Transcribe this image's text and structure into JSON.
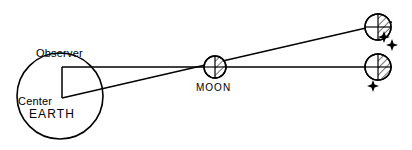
{
  "figure": {
    "type": "astronomy-parallax-diagram",
    "background_color": "#ffffff",
    "stroke_color": "#000000",
    "width": 412,
    "height": 150
  },
  "labels": {
    "observer": "Observer",
    "center": "Center",
    "earth": "EARTH",
    "moon": "MOON"
  },
  "bodies": {
    "earth": {
      "name": "EARTH",
      "cx": 60,
      "cy": 96,
      "r": 43,
      "filled": false
    },
    "moon_center": {
      "name": "MOON",
      "cx": 215,
      "cy": 67,
      "r": 11,
      "shaded_half": "right"
    },
    "moon_apparent_upper": {
      "name": "moon-apparent-from-center",
      "cx": 378,
      "cy": 27,
      "r": 13,
      "shaded_half": "right"
    },
    "moon_apparent_lower": {
      "name": "moon-apparent-from-observer",
      "cx": 378,
      "cy": 67,
      "r": 13,
      "shaded_half": "right"
    }
  },
  "points": {
    "observer": {
      "x": 62,
      "y": 67
    },
    "center": {
      "x": 62,
      "y": 98
    }
  },
  "sight_lines": [
    {
      "name": "observer-sight-line",
      "from": "observer",
      "to": "moon_apparent_lower",
      "x1": 62,
      "y1": 67,
      "x2": 392,
      "y2": 67
    },
    {
      "name": "center-sight-line",
      "from": "center",
      "to": "moon_apparent_upper",
      "x1": 62,
      "y1": 98,
      "x2": 392,
      "y2": 22
    }
  ],
  "radius_line": {
    "name": "earth-radius-line",
    "x1": 62,
    "y1": 67,
    "x2": 62,
    "y2": 98
  },
  "stars": [
    {
      "name": "star-upper-a",
      "cx": 384,
      "cy": 37,
      "r": 5
    },
    {
      "name": "star-upper-b",
      "cx": 392,
      "cy": 45,
      "r": 5
    },
    {
      "name": "star-lower",
      "cx": 373,
      "cy": 86,
      "r": 5
    }
  ]
}
